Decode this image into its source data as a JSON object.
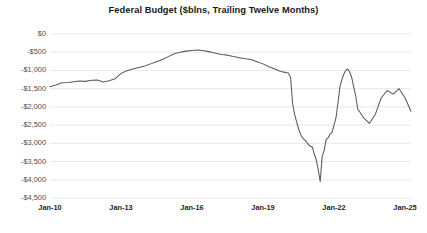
{
  "chart_data": {
    "type": "line",
    "title": "Federal Budget ($blns, Trailing Twelve Months)",
    "xlabel": "",
    "ylabel": "",
    "grid": true,
    "legend": false,
    "line_color": "#595959",
    "ylim": [
      -4500,
      0
    ],
    "yticks": [
      0,
      -500,
      -1000,
      -1500,
      -2000,
      -2500,
      -3000,
      -3500,
      -4000,
      -4500
    ],
    "ytick_labels": [
      "$0",
      "-$500",
      "-$1,000",
      "-$1,500",
      "-$2,000",
      "-$2,500",
      "-$3,000",
      "-$3,500",
      "-$4,000",
      "-$4,500"
    ],
    "xlim": [
      "Jan-10",
      "Jan-25"
    ],
    "xticks": [
      "Jan-10",
      "Jan-13",
      "Jan-16",
      "Jan-19",
      "Jan-22",
      "Jan-25"
    ],
    "x": [
      "Jan-10",
      "Apr-10",
      "Jul-10",
      "Oct-10",
      "Jan-11",
      "Apr-11",
      "Jul-11",
      "Oct-11",
      "Jan-12",
      "Apr-12",
      "Jul-12",
      "Oct-12",
      "Jan-13",
      "Apr-13",
      "Jul-13",
      "Oct-13",
      "Jan-14",
      "Apr-14",
      "Jul-14",
      "Oct-14",
      "Jan-15",
      "Apr-15",
      "Jul-15",
      "Oct-15",
      "Jan-16",
      "Apr-16",
      "Jul-16",
      "Oct-16",
      "Jan-17",
      "Apr-17",
      "Jul-17",
      "Oct-17",
      "Jan-18",
      "Apr-18",
      "Jul-18",
      "Oct-18",
      "Jan-19",
      "Apr-19",
      "Jul-19",
      "Oct-19",
      "Jan-20",
      "Feb-20",
      "Mar-20",
      "Apr-20",
      "May-20",
      "Jun-20",
      "Jul-20",
      "Aug-20",
      "Sep-20",
      "Oct-20",
      "Nov-20",
      "Dec-20",
      "Jan-21",
      "Feb-21",
      "Mar-21",
      "Apr-21",
      "May-21",
      "Jun-21",
      "Jul-21",
      "Aug-21",
      "Sep-21",
      "Oct-21",
      "Nov-21",
      "Dec-21",
      "Jan-22",
      "Feb-22",
      "Mar-22",
      "Apr-22",
      "May-22",
      "Jun-22",
      "Jul-22",
      "Aug-22",
      "Sep-22",
      "Oct-22",
      "Nov-22",
      "Dec-22",
      "Jan-23",
      "Apr-23",
      "Jul-23",
      "Oct-23",
      "Jan-24",
      "Apr-24",
      "Jul-24",
      "Oct-24",
      "Jan-25",
      "Apr-25"
    ],
    "values": [
      -1450,
      -1400,
      -1340,
      -1330,
      -1310,
      -1290,
      -1300,
      -1270,
      -1260,
      -1320,
      -1280,
      -1230,
      -1080,
      -1010,
      -960,
      -920,
      -880,
      -820,
      -760,
      -700,
      -620,
      -540,
      -500,
      -470,
      -450,
      -440,
      -460,
      -490,
      -530,
      -560,
      -580,
      -620,
      -650,
      -680,
      -700,
      -760,
      -820,
      -900,
      -960,
      -1030,
      -1060,
      -1080,
      -1200,
      -1900,
      -2200,
      -2400,
      -2600,
      -2750,
      -2850,
      -2900,
      -2950,
      -3030,
      -3080,
      -3100,
      -3300,
      -3450,
      -3720,
      -4050,
      -3350,
      -3200,
      -2900,
      -2850,
      -2750,
      -2700,
      -2500,
      -2300,
      -1900,
      -1450,
      -1250,
      -1100,
      -1000,
      -960,
      -1050,
      -1200,
      -1450,
      -1700,
      -2050,
      -2300,
      -2450,
      -2200,
      -1750,
      -1550,
      -1650,
      -1500,
      -1750,
      -2120
    ]
  }
}
